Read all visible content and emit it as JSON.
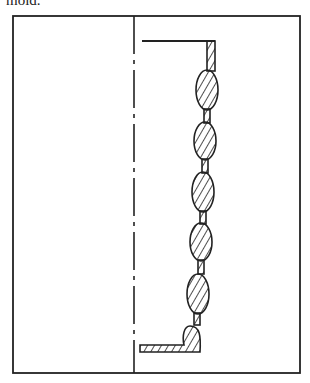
{
  "caption": {
    "text": "mold."
  },
  "diagram": {
    "lobe_count": 6,
    "colors": {
      "ink": "#222222",
      "background": "#ffffff"
    }
  }
}
